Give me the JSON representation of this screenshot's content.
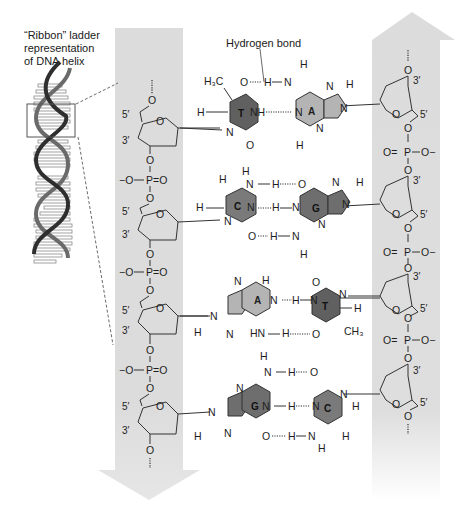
{
  "labels": {
    "ribbon": "“Ribbon” ladder\nrepresentation\nof DNA helix",
    "backbone": "Sugar-\nphosphate\nbackbone",
    "hbond": "Hydrogen bond"
  },
  "colors": {
    "backbone_arrow": "#dcdcdc",
    "purine_A": "#b4b4b4",
    "pyrimidine_T": "#606060",
    "base_C": "#7a7a7a",
    "base_G": "#6e6e6e",
    "helix_strand": "#2e2e2e",
    "line": "#333333"
  },
  "atoms": {
    "O": "O",
    "P": "P",
    "N": "N",
    "H": "H",
    "NH": "NH",
    "HN": "HN",
    "O_minus": "−O",
    "O_minus_r": "O−",
    "H3C": "H₃C",
    "CH3": "CH₃",
    "p5": "5′",
    "p3": "3′"
  },
  "base_pairs": [
    {
      "left": "T",
      "right": "A",
      "hbonds": 2
    },
    {
      "left": "C",
      "right": "G",
      "hbonds": 3
    },
    {
      "left": "A",
      "right": "T",
      "hbonds": 2
    },
    {
      "left": "G",
      "right": "C",
      "hbonds": 3
    }
  ],
  "left_strand": {
    "direction": "down",
    "ends": [
      "5′",
      "3′"
    ]
  },
  "right_strand": {
    "direction": "up",
    "ends": [
      "3′",
      "5′"
    ]
  }
}
